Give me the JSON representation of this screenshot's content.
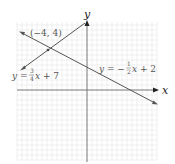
{
  "graph": {
    "x_axis_label": "x",
    "y_axis_label": "y",
    "point_label": "(−4, 4)",
    "line1": {
      "equation_prefix": "y = ",
      "frac_num": "3",
      "frac_den": "4",
      "equation_suffix": "x + 7",
      "slope": 0.75,
      "intercept": 7
    },
    "line2": {
      "equation_prefix": "y = −",
      "frac_num": "1",
      "frac_den": "2",
      "equation_suffix": "x + 2",
      "slope": -0.5,
      "intercept": 2
    },
    "intersection": {
      "x": -4,
      "y": 4
    },
    "colors": {
      "grid": "#e6e6e6",
      "axis": "#777777",
      "line": "#555555",
      "label": "#555555"
    }
  }
}
